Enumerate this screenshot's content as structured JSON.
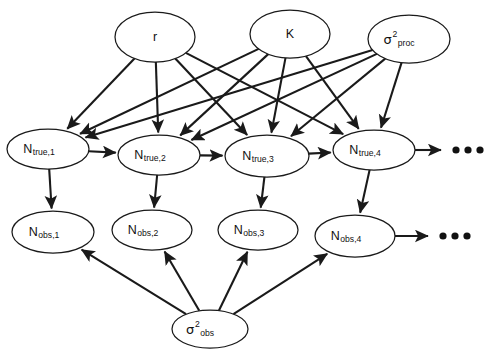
{
  "figure": {
    "kind": "directed-acyclic-graph",
    "background_color": "#ffffff",
    "stroke_color": "#1a1a1a"
  },
  "nodes": [
    {
      "id": "r",
      "label": "r",
      "sup": "",
      "sub": "",
      "cx": 155,
      "cy": 37,
      "rx": 40,
      "ry": 25,
      "row": "parameters"
    },
    {
      "id": "K",
      "label": "K",
      "sup": "",
      "sub": "",
      "cx": 290,
      "cy": 34,
      "rx": 40,
      "ry": 24,
      "row": "parameters"
    },
    {
      "id": "s_proc",
      "label": "σ",
      "sup": "2",
      "sub": "proc",
      "cx": 409,
      "cy": 39,
      "rx": 41,
      "ry": 24,
      "row": "parameters"
    },
    {
      "id": "Ntrue1",
      "label": "N",
      "sup": "",
      "sub": "true,1",
      "cx": 48,
      "cy": 149,
      "rx": 41,
      "ry": 20,
      "row": "latent"
    },
    {
      "id": "Ntrue2",
      "label": "N",
      "sup": "",
      "sub": "true,2",
      "cx": 159,
      "cy": 155,
      "rx": 41,
      "ry": 20,
      "row": "latent"
    },
    {
      "id": "Ntrue3",
      "label": "N",
      "sup": "",
      "sub": "true,3",
      "cx": 267,
      "cy": 156,
      "rx": 42,
      "ry": 21,
      "row": "latent"
    },
    {
      "id": "Ntrue4",
      "label": "N",
      "sup": "",
      "sub": "true,4",
      "cx": 374,
      "cy": 150,
      "rx": 41,
      "ry": 20,
      "row": "latent"
    },
    {
      "id": "Nobs1",
      "label": "N",
      "sup": "",
      "sub": "obs,1",
      "cx": 53,
      "cy": 232,
      "rx": 41,
      "ry": 21,
      "row": "observed"
    },
    {
      "id": "Nobs2",
      "label": "N",
      "sup": "",
      "sub": "obs,2",
      "cx": 152,
      "cy": 230,
      "rx": 40,
      "ry": 20,
      "row": "observed"
    },
    {
      "id": "Nobs3",
      "label": "N",
      "sup": "",
      "sub": "obs,3",
      "cx": 258,
      "cy": 230,
      "rx": 40,
      "ry": 20,
      "row": "observed"
    },
    {
      "id": "Nobs4",
      "label": "N",
      "sup": "",
      "sub": "obs,4",
      "cx": 355,
      "cy": 236,
      "rx": 40,
      "ry": 21,
      "row": "observed"
    },
    {
      "id": "s_obs",
      "label": "σ",
      "sup": "2",
      "sub": "obs",
      "cx": 210,
      "cy": 329,
      "rx": 38,
      "ry": 19,
      "row": "parameters"
    }
  ],
  "edges": [
    {
      "from": "r",
      "to": "Ntrue1"
    },
    {
      "from": "r",
      "to": "Ntrue2"
    },
    {
      "from": "r",
      "to": "Ntrue3"
    },
    {
      "from": "r",
      "to": "Ntrue4"
    },
    {
      "from": "K",
      "to": "Ntrue1"
    },
    {
      "from": "K",
      "to": "Ntrue2"
    },
    {
      "from": "K",
      "to": "Ntrue3"
    },
    {
      "from": "K",
      "to": "Ntrue4"
    },
    {
      "from": "s_proc",
      "to": "Ntrue1"
    },
    {
      "from": "s_proc",
      "to": "Ntrue2"
    },
    {
      "from": "s_proc",
      "to": "Ntrue3"
    },
    {
      "from": "s_proc",
      "to": "Ntrue4"
    },
    {
      "from": "Ntrue1",
      "to": "Ntrue2"
    },
    {
      "from": "Ntrue2",
      "to": "Ntrue3"
    },
    {
      "from": "Ntrue3",
      "to": "Ntrue4"
    },
    {
      "from": "Ntrue1",
      "to": "Nobs1"
    },
    {
      "from": "Ntrue2",
      "to": "Nobs2"
    },
    {
      "from": "Ntrue3",
      "to": "Nobs3"
    },
    {
      "from": "Ntrue4",
      "to": "Nobs4"
    },
    {
      "from": "s_obs",
      "to": "Nobs1"
    },
    {
      "from": "s_obs",
      "to": "Nobs2"
    },
    {
      "from": "s_obs",
      "to": "Nobs3"
    },
    {
      "from": "s_obs",
      "to": "Nobs4"
    }
  ],
  "continuation_arrows": [
    {
      "id": "latent-continuation",
      "from": "Ntrue4",
      "x2": 441,
      "y": 150
    },
    {
      "id": "observed-continuation",
      "from": "Nobs4",
      "x2": 428,
      "y": 236
    }
  ],
  "ellipses_marks": [
    {
      "id": "latent-ellipsis",
      "cy": 150,
      "dots": [
        456,
        468,
        480
      ],
      "r": 3.6
    },
    {
      "id": "observed-ellipsis",
      "cy": 236,
      "dots": [
        443,
        455,
        467
      ],
      "r": 3.6
    }
  ]
}
